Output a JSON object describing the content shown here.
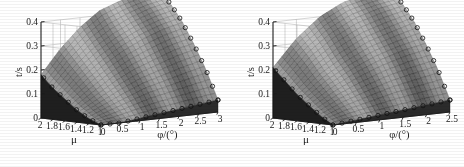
{
  "figure": {
    "title": "",
    "background": "#ffffff",
    "panels": [
      {
        "id": "left",
        "zlabel": "t/s",
        "xlabel": "φ/(°)",
        "ylabel": "μ",
        "zticks": [
          "0",
          "0.1",
          "0.2",
          "0.3",
          "0.4"
        ],
        "xticks": [
          "0",
          "0.5",
          "1",
          "1.5",
          "2",
          "2.5",
          "3"
        ],
        "yticks": [
          "2",
          "1.8",
          "1.6",
          "1.4",
          "1.2",
          "1"
        ]
      },
      {
        "id": "right",
        "zlabel": "t/s",
        "xlabel": "φ/(°)",
        "ylabel": "μ",
        "zticks": [
          "0",
          "0.1",
          "0.2",
          "0.3",
          "0.4"
        ],
        "xticks": [
          "0",
          "0.5",
          "1",
          "1.5",
          "2",
          "2.5"
        ],
        "yticks": [
          "2",
          "1.8",
          "1.6",
          "1.4",
          "1.2",
          "1"
        ]
      }
    ]
  },
  "chart_data": [
    {
      "type": "surface",
      "panel": "left",
      "title": "",
      "xlabel": "φ/(°)",
      "ylabel": "μ",
      "zlabel": "t/s",
      "xlim": [
        0,
        3
      ],
      "ylim": [
        1,
        2
      ],
      "zlim": [
        0,
        0.4
      ],
      "xticks": [
        0,
        0.5,
        1,
        1.5,
        2,
        2.5,
        3
      ],
      "yticks": [
        1,
        1.2,
        1.4,
        1.6,
        1.8,
        2
      ],
      "zticks": [
        0,
        0.1,
        0.2,
        0.3,
        0.4
      ],
      "grid": true,
      "legend": false,
      "markers": "open-circle on surface edges",
      "colormap": "grayscale",
      "x": [
        0,
        0.5,
        1,
        1.5,
        2,
        2.5,
        3
      ],
      "y": [
        1,
        1.2,
        1.4,
        1.6,
        1.8,
        2
      ],
      "z": [
        [
          0.0,
          0.0,
          0.01,
          0.02,
          0.03,
          0.04,
          0.05
        ],
        [
          0.02,
          0.05,
          0.08,
          0.11,
          0.13,
          0.15,
          0.17
        ],
        [
          0.05,
          0.1,
          0.15,
          0.19,
          0.22,
          0.25,
          0.27
        ],
        [
          0.09,
          0.16,
          0.22,
          0.27,
          0.31,
          0.34,
          0.36
        ],
        [
          0.13,
          0.22,
          0.29,
          0.34,
          0.38,
          0.41,
          0.43
        ],
        [
          0.18,
          0.28,
          0.36,
          0.42,
          0.45,
          0.47,
          0.48
        ]
      ],
      "description": "Monotonically increasing surface: t rises with both μ and φ, with a steep near-vertical dark drop along the μ=1 front edge."
    },
    {
      "type": "surface",
      "panel": "right",
      "title": "",
      "xlabel": "φ/(°)",
      "ylabel": "μ",
      "zlabel": "t/s",
      "xlim": [
        0,
        2.5
      ],
      "ylim": [
        1,
        2
      ],
      "zlim": [
        0,
        0.4
      ],
      "xticks": [
        0,
        0.5,
        1,
        1.5,
        2,
        2.5
      ],
      "yticks": [
        1,
        1.2,
        1.4,
        1.6,
        1.8,
        2
      ],
      "zticks": [
        0,
        0.1,
        0.2,
        0.3,
        0.4
      ],
      "grid": true,
      "legend": false,
      "markers": "open-circle on surface edges",
      "colormap": "grayscale",
      "x": [
        0,
        0.5,
        1,
        1.5,
        2,
        2.5
      ],
      "y": [
        1,
        1.2,
        1.4,
        1.6,
        1.8,
        2
      ],
      "z": [
        [
          0.0,
          0.01,
          0.02,
          0.03,
          0.04,
          0.05
        ],
        [
          0.03,
          0.07,
          0.1,
          0.13,
          0.15,
          0.17
        ],
        [
          0.07,
          0.13,
          0.18,
          0.22,
          0.25,
          0.27
        ],
        [
          0.11,
          0.19,
          0.25,
          0.3,
          0.33,
          0.36
        ],
        [
          0.16,
          0.26,
          0.33,
          0.38,
          0.41,
          0.43
        ],
        [
          0.21,
          0.32,
          0.4,
          0.45,
          0.47,
          0.48
        ]
      ],
      "description": "Same family of surfaces as the left panel but over a narrower φ range (0–2.5°); steep dark face along the μ=1 edge."
    }
  ]
}
